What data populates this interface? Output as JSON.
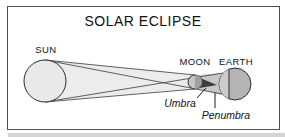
{
  "title": "SOLAR ECLIPSE",
  "labels": {
    "sun": "SUN",
    "moon": "MOON",
    "earth": "EARTH",
    "umbra": "Umbra",
    "penumbra": "Penumbra"
  },
  "colors": {
    "background": "#ffffff",
    "frame_border": "#4f4f4f",
    "beam_fill": "#ececec",
    "sun_fill": "#e9e9e9",
    "penumbra_fill": "#c8c8c8",
    "umbra_fill": "#3d3d3d",
    "moon_fill": "#c6c6c6",
    "moon_shadow_fill": "#a0a0a0",
    "earth_fill": "#b4b4b4",
    "earth_lit_fill": "#cbcbcb",
    "outline": "#2e2e2e",
    "text": "#111111"
  }
}
